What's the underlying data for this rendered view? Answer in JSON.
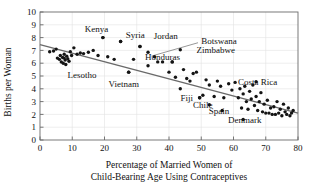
{
  "chart_data": {
    "type": "scatter",
    "title": "",
    "xlabel": "Percentage of Married Women of Child-Bearing Age Using Contraceptives",
    "xlabel_line1": "Percentage of Married Women of",
    "xlabel_line2": "Child-Bearing Age Using Contraceptives",
    "ylabel": "Births per Woman",
    "xlim": [
      0,
      80
    ],
    "ylim": [
      0,
      10
    ],
    "xticks": [
      0,
      10,
      20,
      30,
      40,
      50,
      60,
      70,
      80
    ],
    "yticks": [
      0,
      1,
      2,
      3,
      4,
      5,
      6,
      7,
      8,
      9,
      10
    ],
    "grid": true,
    "legend": "none",
    "marker_color": "#141414",
    "trendline_color": "#6a6a6a",
    "grid_color": "#e2e2e2",
    "trendline": {
      "x": [
        0,
        80
      ],
      "y": [
        7.45,
        2.1
      ],
      "description": "negative linear fit drawn across full x range"
    },
    "points": [
      {
        "x": 3.0,
        "y": 6.9
      },
      {
        "x": 4.2,
        "y": 6.95
      },
      {
        "x": 5.0,
        "y": 7.1
      },
      {
        "x": 5.4,
        "y": 6.4
      },
      {
        "x": 6.0,
        "y": 6.3
      },
      {
        "x": 6.3,
        "y": 6.6
      },
      {
        "x": 6.6,
        "y": 6.1
      },
      {
        "x": 7.0,
        "y": 6.45
      },
      {
        "x": 7.2,
        "y": 6.0
      },
      {
        "x": 7.5,
        "y": 6.7
      },
      {
        "x": 7.8,
        "y": 6.25
      },
      {
        "x": 8.0,
        "y": 5.9
      },
      {
        "x": 8.3,
        "y": 6.55
      },
      {
        "x": 8.6,
        "y": 6.35
      },
      {
        "x": 9.0,
        "y": 6.15
      },
      {
        "x": 9.4,
        "y": 6.9
      },
      {
        "x": 9.8,
        "y": 6.6
      },
      {
        "x": 10.5,
        "y": 7.2
      },
      {
        "x": 11.5,
        "y": 6.7
      },
      {
        "x": 12.5,
        "y": 6.8
      },
      {
        "x": 13.5,
        "y": 6.75
      },
      {
        "x": 15.0,
        "y": 6.85
      },
      {
        "x": 16.5,
        "y": 7.0
      },
      {
        "x": 18.0,
        "y": 6.6
      },
      {
        "x": 19.5,
        "y": 8.0
      },
      {
        "x": 21.0,
        "y": 6.5
      },
      {
        "x": 23.0,
        "y": 6.3
      },
      {
        "x": 25.0,
        "y": 7.7
      },
      {
        "x": 27.5,
        "y": 5.3
      },
      {
        "x": 29.0,
        "y": 6.3
      },
      {
        "x": 31.0,
        "y": 7.3
      },
      {
        "x": 33.5,
        "y": 5.8
      },
      {
        "x": 35.5,
        "y": 6.5
      },
      {
        "x": 36.5,
        "y": 6.1
      },
      {
        "x": 38.0,
        "y": 6.1
      },
      {
        "x": 40.0,
        "y": 5.3
      },
      {
        "x": 41.0,
        "y": 6.1
      },
      {
        "x": 42.0,
        "y": 4.9
      },
      {
        "x": 43.5,
        "y": 4.0
      },
      {
        "x": 44.5,
        "y": 5.5
      },
      {
        "x": 45.5,
        "y": 4.8
      },
      {
        "x": 46.5,
        "y": 4.6
      },
      {
        "x": 47.5,
        "y": 5.2
      },
      {
        "x": 48.5,
        "y": 5.3
      },
      {
        "x": 49.5,
        "y": 3.3
      },
      {
        "x": 50.5,
        "y": 3.5
      },
      {
        "x": 51.5,
        "y": 4.7
      },
      {
        "x": 52.5,
        "y": 4.3
      },
      {
        "x": 54.0,
        "y": 3.4
      },
      {
        "x": 55.0,
        "y": 4.6
      },
      {
        "x": 56.0,
        "y": 4.2
      },
      {
        "x": 57.0,
        "y": 3.3
      },
      {
        "x": 58.5,
        "y": 4.4
      },
      {
        "x": 59.5,
        "y": 3.9
      },
      {
        "x": 60.5,
        "y": 4.5
      },
      {
        "x": 61.5,
        "y": 3.3
      },
      {
        "x": 62.0,
        "y": 4.0
      },
      {
        "x": 62.5,
        "y": 2.5
      },
      {
        "x": 63.0,
        "y": 3.6
      },
      {
        "x": 63.5,
        "y": 4.2
      },
      {
        "x": 64.0,
        "y": 3.0
      },
      {
        "x": 64.5,
        "y": 2.4
      },
      {
        "x": 65.0,
        "y": 3.8
      },
      {
        "x": 65.5,
        "y": 3.2
      },
      {
        "x": 66.0,
        "y": 4.3
      },
      {
        "x": 66.5,
        "y": 2.7
      },
      {
        "x": 67.0,
        "y": 3.4
      },
      {
        "x": 67.5,
        "y": 2.3
      },
      {
        "x": 68.0,
        "y": 3.0
      },
      {
        "x": 68.5,
        "y": 3.7
      },
      {
        "x": 69.0,
        "y": 2.2
      },
      {
        "x": 69.5,
        "y": 2.8
      },
      {
        "x": 70.0,
        "y": 2.1
      },
      {
        "x": 70.5,
        "y": 3.1
      },
      {
        "x": 71.0,
        "y": 2.1
      },
      {
        "x": 71.5,
        "y": 2.5
      },
      {
        "x": 72.0,
        "y": 2.0
      },
      {
        "x": 72.5,
        "y": 2.6
      },
      {
        "x": 73.0,
        "y": 2.0
      },
      {
        "x": 73.5,
        "y": 3.0
      },
      {
        "x": 74.0,
        "y": 2.1
      },
      {
        "x": 74.5,
        "y": 2.4
      },
      {
        "x": 75.0,
        "y": 1.9
      },
      {
        "x": 75.5,
        "y": 2.8
      },
      {
        "x": 76.0,
        "y": 2.2
      },
      {
        "x": 76.5,
        "y": 2.0
      },
      {
        "x": 77.0,
        "y": 2.5
      },
      {
        "x": 77.5,
        "y": 1.9
      },
      {
        "x": 78.0,
        "y": 2.1
      },
      {
        "x": 78.5,
        "y": 2.3
      }
    ],
    "annotations": [
      {
        "text": "Kenya",
        "x": 19.5,
        "y": 8.0,
        "label_x": 17.5,
        "label_y": 8.7,
        "anchor": "middle",
        "leader": false
      },
      {
        "text": "Syria",
        "x": 25.0,
        "y": 7.7,
        "label_x": 29.5,
        "label_y": 8.2,
        "anchor": "middle",
        "leader": false
      },
      {
        "text": "Jordan",
        "x": 31.0,
        "y": 7.3,
        "label_x": 39.0,
        "label_y": 8.1,
        "anchor": "middle",
        "leader": false
      },
      {
        "text": "Botswana",
        "x": 33.5,
        "y": 6.85,
        "label_x": 50.0,
        "label_y": 7.7,
        "anchor": "start",
        "leader": true
      },
      {
        "text": "Zimbabwe",
        "x": 43.5,
        "y": 7.05,
        "label_x": 48.5,
        "label_y": 7.05,
        "anchor": "start",
        "leader": false
      },
      {
        "text": "Honduras",
        "x": 41.0,
        "y": 6.1,
        "label_x": 38.0,
        "label_y": 6.5,
        "anchor": "middle",
        "leader": false
      },
      {
        "text": "Lesotho",
        "x": 7.5,
        "y": 6.4,
        "label_x": 13.0,
        "label_y": 5.1,
        "anchor": "middle",
        "leader": false
      },
      {
        "text": "Vietnam",
        "x": 27.5,
        "y": 5.3,
        "label_x": 26.0,
        "label_y": 4.4,
        "anchor": "middle",
        "leader": false
      },
      {
        "text": "Fiji",
        "x": 49.5,
        "y": 3.3,
        "label_x": 45.5,
        "label_y": 3.25,
        "anchor": "middle",
        "leader": false
      },
      {
        "text": "Chile",
        "x": 52.5,
        "y": 2.75,
        "label_x": 50.5,
        "label_y": 2.75,
        "anchor": "middle",
        "leader": false
      },
      {
        "text": "Spain",
        "x": 56.5,
        "y": 2.3,
        "label_x": 55.5,
        "label_y": 2.25,
        "anchor": "middle",
        "leader": false
      },
      {
        "text": "Costa Rica",
        "x": 67.0,
        "y": 4.55,
        "label_x": 67.5,
        "label_y": 4.55,
        "anchor": "middle",
        "leader": false
      },
      {
        "text": "Denmark",
        "x": 63.0,
        "y": 1.6,
        "label_x": 63.5,
        "label_y": 1.55,
        "anchor": "middle",
        "leader": false
      }
    ],
    "leader_lines": [
      {
        "from_x": 49.0,
        "from_y": 7.6,
        "to_x": 34.5,
        "to_y": 6.55
      }
    ]
  }
}
